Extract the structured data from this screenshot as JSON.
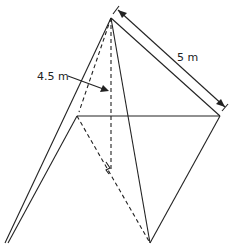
{
  "diagram": {
    "type": "pyramid",
    "labels": {
      "slant_edge": "5 m",
      "height": "4.5 m"
    },
    "colors": {
      "stroke": "#222222",
      "background": "#ffffff"
    }
  }
}
